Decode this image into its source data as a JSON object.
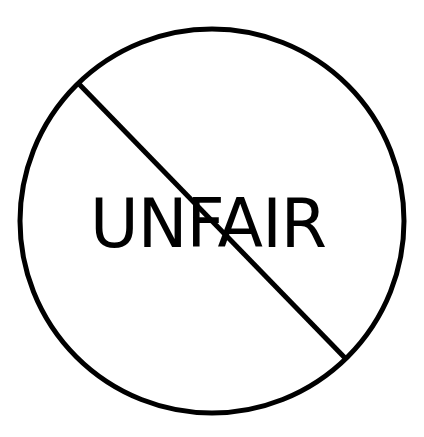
{
  "sign": {
    "word": "UNFAIR",
    "type": "prohibition-sign",
    "stroke_color": "#000000",
    "background_color": "#ffffff"
  },
  "top_fragment": {
    "text": ""
  }
}
